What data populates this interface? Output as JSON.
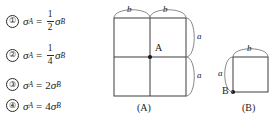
{
  "question": {
    "options": [
      {
        "number": "①",
        "lhs": "σ",
        "lhs_sub": "A",
        "relation": "=",
        "coefficient_type": "fraction",
        "numerator": "1",
        "denominator": "2",
        "rhs": "σ",
        "rhs_sub": "B",
        "text": "① σA = 1/2 σB"
      },
      {
        "number": "②",
        "lhs": "σ",
        "lhs_sub": "A",
        "relation": "=",
        "coefficient_type": "fraction",
        "numerator": "1",
        "denominator": "4",
        "rhs": "σ",
        "rhs_sub": "B",
        "text": "② σA = 1/4 σB"
      },
      {
        "number": "③",
        "lhs": "σ",
        "lhs_sub": "A",
        "relation": "=",
        "coefficient_type": "integer",
        "coefficient": "2",
        "rhs": "σ",
        "rhs_sub": "B",
        "text": "③ σA = 2σB"
      },
      {
        "number": "④",
        "lhs": "σ",
        "lhs_sub": "A",
        "relation": "=",
        "coefficient_type": "integer",
        "coefficient": "4",
        "rhs": "σ",
        "rhs_sub": "B",
        "text": "④ σA = 4σB"
      }
    ]
  },
  "figures": [
    {
      "id": "figure-a",
      "caption": "(A)",
      "point_label": "A",
      "grid": {
        "columns": 2,
        "rows": 2
      },
      "top_dimensions": [
        "b",
        "b"
      ],
      "right_dimensions": [
        "a",
        "a"
      ],
      "point_position": "center"
    },
    {
      "id": "figure-b",
      "caption": "(B)",
      "point_label": "B",
      "grid": {
        "columns": 1,
        "rows": 1
      },
      "top_dimensions": [
        "b"
      ],
      "left_dimensions": [
        "a"
      ],
      "point_position": "bottom-left"
    }
  ],
  "style": {
    "line_color": "#3c3c3c",
    "brace_color": "#6b6b6b",
    "text_color": "#1a1a1a",
    "background": "#ffffff"
  }
}
